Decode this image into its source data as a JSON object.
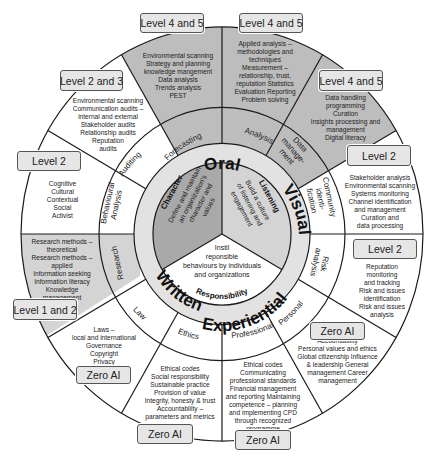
{
  "diagram": {
    "type": "concentric-wheel",
    "center": {
      "x": 222,
      "y": 234
    },
    "colors": {
      "line": "#1a1a1a",
      "shade_dark": "#a9a9a9",
      "shade_mid": "#bdbdbd",
      "shade_light": "#d4d4d4",
      "mode_ring": "#e2e2e2",
      "white": "#ffffff",
      "badge_fill": "#e6e6e6"
    },
    "core": [
      {
        "id": "character",
        "title": "Character",
        "body": "Define and maintain an organization's character and values"
      },
      {
        "id": "listening",
        "title": "Listening",
        "body": "Build a culture of listening and engagement"
      },
      {
        "id": "responsibility",
        "title": "Responsibility",
        "body_lines": [
          "Instil",
          "reponsible",
          "behaviours by individuals",
          "and organizations"
        ]
      }
    ],
    "modes": [
      "Oral",
      "Visual",
      "Experiential",
      "Written"
    ],
    "sectors": [
      {
        "label": "Forecasting",
        "level": "Level 4 and 5",
        "items": [
          "Environmental scanning",
          "Strategy and planning",
          "knowledge mangement",
          "Data analysis",
          "Trends analysis",
          "PEST"
        ]
      },
      {
        "label": "Analysis",
        "level": "Level 4 and 5",
        "items": [
          "Applied analysis –",
          "methodologies and",
          "techniques",
          "Measurement –",
          "relationship, trust,",
          "reputation Statistics",
          "Evaluation Reporting",
          "Problem solving"
        ]
      },
      {
        "label": "Data manage-ment",
        "label_lines": [
          "Data",
          "manage-",
          "ment"
        ],
        "level": "Level 4 and 5",
        "items": [
          "Data handling",
          "programming",
          "Curation",
          "Insights processing and",
          "management",
          "Digital literacy"
        ]
      },
      {
        "label": "Community identi-fication",
        "label_lines": [
          "Community",
          "identi-",
          "fication"
        ],
        "level": "Level 2",
        "items": [
          "Stakeholder analysis",
          "Environmental scanning",
          "Systems monitoring",
          "Channel identification",
          "and management",
          "Curation and",
          "data processing"
        ]
      },
      {
        "label": "Risk analysis",
        "label_lines": [
          "Risk",
          "analysis"
        ],
        "level": "Level 2",
        "items": [
          "Reputation",
          "monitoring",
          "and tracking",
          "Risk and issues",
          "identification",
          "Risk and issues",
          "analysis"
        ]
      },
      {
        "label": "Personal",
        "level": "Zero AI",
        "items": [
          "Accountability",
          "Personal values and ethics",
          "Global citizenship Influence",
          "& leadership General",
          "management Career",
          "management"
        ]
      },
      {
        "label": "Professional",
        "level": "Zero AI",
        "items": [
          "Ethical codes",
          "Communicating",
          "professional standards",
          "Financial management",
          "and reporting Maintaining",
          "competence – planning",
          "and implementing CPD",
          "through recognized",
          "programme"
        ]
      },
      {
        "label": "Ethics",
        "level": "Zero AI",
        "items": [
          "Ethical codes",
          "Social responsibility",
          "Sustainable practice",
          "Provision of value",
          "Integrity, honesty & trust",
          "Accountability –",
          "parameters and metrics"
        ]
      },
      {
        "label": "Law",
        "level": "Zero AI",
        "items": [
          "Laws –",
          "local and international",
          "Governance",
          "Copyright",
          "Privacy"
        ]
      },
      {
        "label": "Research",
        "level": "Level 1 and 2",
        "items": [
          "Research methods –",
          "theoretical",
          "Research methods –",
          "applied",
          "Information seeking",
          "Information literacy",
          "Knowledge",
          "management"
        ]
      },
      {
        "label": "Behavioural Analysis",
        "label_lines": [
          "Behavioural",
          "Analysis"
        ],
        "level": "Level 2",
        "items": [
          "Cognitive",
          "Cultural",
          "Contextual",
          "Social",
          "Activist"
        ]
      },
      {
        "label": "Auditing",
        "level": "Level 2 and 3",
        "items": [
          "Environmental scanning",
          "Communication audits –",
          "internal and external",
          "Stakeholder audits",
          "Relationship audits",
          "Reputation",
          "audits"
        ]
      }
    ]
  }
}
